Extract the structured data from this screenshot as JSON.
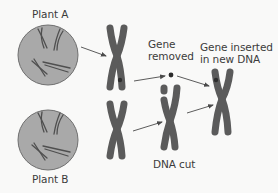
{
  "diagram": {
    "title": "",
    "colors": {
      "background": "#f9f9f8",
      "cell_fill": "#a9a9a9",
      "cell_stroke": "#6e6e6e",
      "chromosome": "#5b5b5b",
      "gene_spot": "#2e2e2e",
      "arrow": "#4a4a4a",
      "text": "#3b3b3b"
    },
    "nodes": [
      {
        "id": "plant_a",
        "type": "cell",
        "label": "Plant A"
      },
      {
        "id": "plant_b",
        "type": "cell",
        "label": "Plant B"
      },
      {
        "id": "chrom_a",
        "type": "chromosome",
        "label": "",
        "note": "has gene marked with dark spot"
      },
      {
        "id": "chrom_b",
        "type": "chromosome",
        "label": ""
      },
      {
        "id": "gene",
        "type": "gene",
        "label": "Gene removed"
      },
      {
        "id": "cut_chrom",
        "type": "chromosome",
        "label": "DNA cut"
      },
      {
        "id": "new_chrom",
        "type": "chromosome",
        "label": "Gene inserted in new DNA"
      }
    ],
    "edges": [
      {
        "from": "plant_a",
        "to": "chrom_a"
      },
      {
        "from": "plant_b",
        "to": "chrom_b"
      },
      {
        "from": "chrom_a",
        "to": "gene"
      },
      {
        "from": "chrom_b",
        "to": "cut_chrom"
      },
      {
        "from": "gene",
        "to": "new_chrom"
      },
      {
        "from": "cut_chrom",
        "to": "new_chrom"
      }
    ],
    "labels": {
      "plant_a": "Plant A",
      "plant_b": "Plant B",
      "gene_removed_line1": "Gene",
      "gene_removed_line2": "removed",
      "gene_inserted_line1": "Gene inserted",
      "gene_inserted_line2": "in new DNA",
      "dna_cut": "DNA cut"
    }
  }
}
